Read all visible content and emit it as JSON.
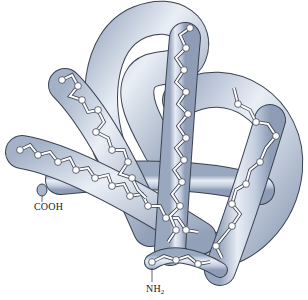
{
  "figure": {
    "colors": {
      "tube_fill": "#c9d3e4",
      "tube_highlight": "#eef2f8",
      "tube_shadow": "#8e9cb5",
      "outline": "#3a4150",
      "atom": "#ffffff",
      "background": "#ffffff"
    },
    "labels": {
      "c_terminus": "COOH",
      "n_terminus_main": "NH",
      "n_terminus_sub": "2"
    }
  }
}
